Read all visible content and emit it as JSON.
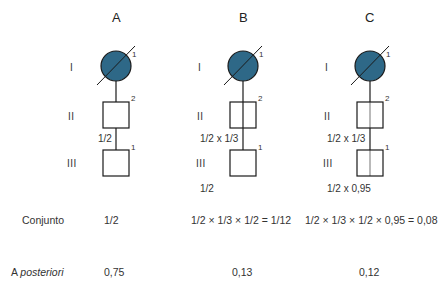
{
  "colors": {
    "affected_fill": "#2e6887",
    "stroke": "#1a1a1a",
    "line_gray": "#8a8a8a"
  },
  "generations": [
    "I",
    "II",
    "III"
  ],
  "columns": [
    {
      "title": "A",
      "individuals": {
        "I": "1",
        "II": "2",
        "III": "1"
      },
      "prob_between_II_III": "1/2",
      "prob_below_III": "",
      "conjunto": "1/2",
      "a_posteriori": "0,75"
    },
    {
      "title": "B",
      "individuals": {
        "I": "1",
        "II": "2",
        "III": "1"
      },
      "prob_between_II_III": "1/2 x 1/3",
      "prob_below_III": "1/2",
      "conjunto": "1/2 × 1/3 × 1/2 = 1/12",
      "a_posteriori": "0,13"
    },
    {
      "title": "C",
      "individuals": {
        "I": "1",
        "II": "2",
        "III": "1"
      },
      "prob_between_II_III": "1/2 x 1/3",
      "prob_below_III": "1/2 x 0,95",
      "conjunto": "1/2 × 1/3 × 1/2 × 0,95 = 0,08",
      "a_posteriori": "0,12"
    }
  ],
  "rows": {
    "conjunto_label": "Conjunto",
    "a_posteriori_prefix": "A ",
    "a_posteriori_italic": "posteriori"
  }
}
